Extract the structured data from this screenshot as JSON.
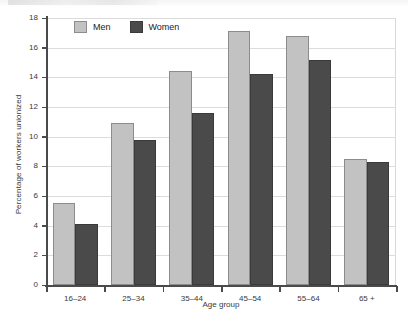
{
  "chart_data": {
    "type": "bar",
    "title": "",
    "xlabel": "Age group",
    "ylabel": "Percentage of workers unionized",
    "categories": [
      "16–24",
      "25–34",
      "35–44",
      "45–54",
      "55–64",
      "65 +"
    ],
    "series": [
      {
        "name": "Men",
        "color": "#c2c2c2",
        "values": [
          5.5,
          10.9,
          14.4,
          17.1,
          16.8,
          8.5
        ]
      },
      {
        "name": "Women",
        "color": "#4a4a4a",
        "values": [
          4.1,
          9.8,
          11.6,
          14.2,
          15.2,
          8.3
        ]
      }
    ],
    "ylim": [
      0,
      18
    ],
    "yticks": [
      0,
      2,
      4,
      6,
      8,
      10,
      12,
      14,
      16,
      18
    ],
    "ytick_labels": [
      "0",
      "2",
      "4",
      "6",
      "8",
      "10",
      "12",
      "14",
      "16",
      "18"
    ],
    "grid": "horizontal",
    "legend_position": "top-inside-left"
  },
  "colors": {
    "men": "#c2c2c2",
    "men_edge": "#8c8c8c",
    "women": "#4a4a4a",
    "women_edge": "#3a3a3a",
    "axis": "#4a4a4a",
    "grid": "#dcdcdc",
    "text": "#3a3a3a",
    "background": "#ffffff"
  }
}
